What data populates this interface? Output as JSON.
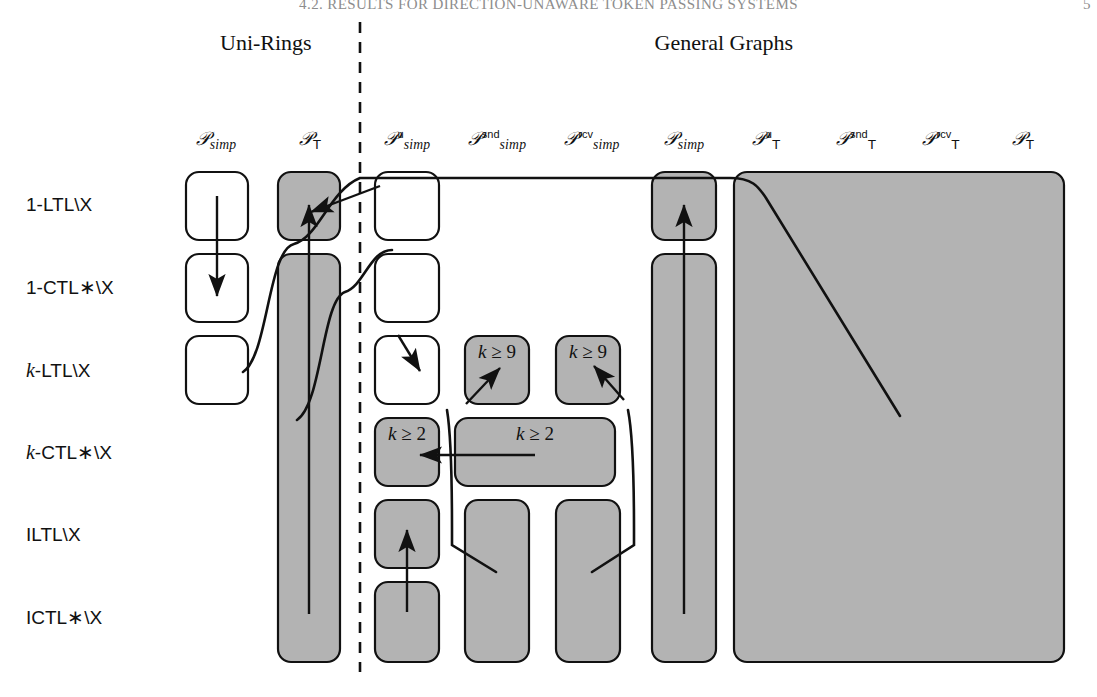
{
  "running_header": {
    "text": "4.2. RESULTS FOR DIRECTION-UNAWARE TOKEN PASSING SYSTEMS",
    "page": "5"
  },
  "groups": [
    {
      "name": "uni-rings",
      "label": "Uni-Rings",
      "cx": 266,
      "y": 30
    },
    {
      "name": "general-graphs",
      "label": "General Graphs",
      "cx": 724,
      "y": 30
    }
  ],
  "divider": {
    "x": 360,
    "y1": 22,
    "y2": 672,
    "style": "dashed"
  },
  "columns": [
    {
      "key": "ur_simp",
      "cx": 216,
      "base": "P",
      "sub": "simp",
      "sup": "",
      "tsub": false
    },
    {
      "key": "ur_T",
      "cx": 310,
      "base": "P",
      "sub": "",
      "sup": "",
      "tsub": true
    },
    {
      "key": "gg_simp_u",
      "cx": 407,
      "base": "P",
      "sub": "simp",
      "sup": "u",
      "tsub": false
    },
    {
      "key": "gg_simp_s",
      "cx": 497,
      "base": "P",
      "sub": "simp",
      "sup": "snd",
      "tsub": false
    },
    {
      "key": "gg_simp_r",
      "cx": 592,
      "base": "P",
      "sub": "simp",
      "sup": "rcv",
      "tsub": false
    },
    {
      "key": "gg_simp",
      "cx": 684,
      "base": "P",
      "sub": "simp",
      "sup": "",
      "tsub": false
    },
    {
      "key": "gg_T_u",
      "cx": 766,
      "base": "P",
      "sub": "",
      "sup": "u",
      "tsub": true
    },
    {
      "key": "gg_T_snd",
      "cx": 856,
      "base": "P",
      "sub": "",
      "sup": "snd",
      "tsub": true
    },
    {
      "key": "gg_T_rcv",
      "cx": 941,
      "base": "P",
      "sub": "",
      "sup": "rcv",
      "tsub": true
    },
    {
      "key": "gg_T",
      "cx": 1023,
      "base": "P",
      "sub": "",
      "sup": "",
      "tsub": true
    }
  ],
  "col_header_y": 128,
  "rows": [
    {
      "key": "r1",
      "label_html": "1-LTL\\X",
      "cy": 205
    },
    {
      "key": "r2",
      "label_html": "1-CTL*\\X",
      "cy": 287
    },
    {
      "key": "r3",
      "label_html": "k-LTL\\X",
      "cy": 370
    },
    {
      "key": "r4",
      "label_html": "k-CTL*\\X",
      "cy": 452
    },
    {
      "key": "r5",
      "label_html": "ILTL\\X",
      "cy": 535
    },
    {
      "key": "r6",
      "label_html": "ICTL*\\X",
      "cy": 617
    }
  ],
  "row_label_x": 26,
  "boxes": [
    {
      "name": "box-ur-simp-r1",
      "x": 186,
      "y": 172,
      "w": 62,
      "h": 68,
      "fill": "white"
    },
    {
      "name": "box-ur-simp-r2",
      "x": 186,
      "y": 254,
      "w": 62,
      "h": 68,
      "fill": "white"
    },
    {
      "name": "box-ur-simp-r3",
      "x": 186,
      "y": 336,
      "w": 62,
      "h": 68,
      "fill": "white"
    },
    {
      "name": "box-ur-T-r1",
      "x": 278,
      "y": 172,
      "w": 62,
      "h": 68,
      "fill": "gray"
    },
    {
      "name": "box-ur-T-r2r6",
      "x": 278,
      "y": 254,
      "w": 62,
      "h": 408,
      "fill": "gray"
    },
    {
      "name": "box-gg-simpu-r1",
      "x": 375,
      "y": 172,
      "w": 64,
      "h": 68,
      "fill": "white"
    },
    {
      "name": "box-gg-simpu-r2",
      "x": 375,
      "y": 254,
      "w": 64,
      "h": 68,
      "fill": "white"
    },
    {
      "name": "box-gg-simpu-r3",
      "x": 375,
      "y": 336,
      "w": 64,
      "h": 68,
      "fill": "white"
    },
    {
      "name": "box-gg-simpu-r4",
      "x": 375,
      "y": 418,
      "w": 64,
      "h": 68,
      "fill": "gray"
    },
    {
      "name": "box-gg-simpu-r5",
      "x": 375,
      "y": 500,
      "w": 64,
      "h": 68,
      "fill": "gray"
    },
    {
      "name": "box-gg-simpu-r6",
      "x": 375,
      "y": 582,
      "w": 64,
      "h": 80,
      "fill": "gray"
    },
    {
      "name": "box-gg-simpsnd-r3",
      "x": 465,
      "y": 336,
      "w": 64,
      "h": 68,
      "fill": "gray"
    },
    {
      "name": "box-gg-simpsnd-r4",
      "x": 455,
      "y": 418,
      "w": 160,
      "h": 68,
      "fill": "gray"
    },
    {
      "name": "box-gg-simpsnd-r5",
      "x": 465,
      "y": 500,
      "w": 64,
      "h": 162,
      "fill": "gray"
    },
    {
      "name": "box-gg-simprcv-r3",
      "x": 556,
      "y": 336,
      "w": 64,
      "h": 68,
      "fill": "gray"
    },
    {
      "name": "box-gg-simprcv-r5",
      "x": 556,
      "y": 500,
      "w": 64,
      "h": 162,
      "fill": "gray"
    },
    {
      "name": "box-gg-simp-r1",
      "x": 652,
      "y": 172,
      "w": 64,
      "h": 68,
      "fill": "gray"
    },
    {
      "name": "box-gg-simp-r2r6",
      "x": 652,
      "y": 254,
      "w": 64,
      "h": 408,
      "fill": "gray"
    },
    {
      "name": "box-gg-T-all",
      "x": 734,
      "y": 172,
      "w": 330,
      "h": 490,
      "fill": "gray"
    }
  ],
  "cell_notes": [
    {
      "name": "note-k-ge-9-snd",
      "text": "k ≥ 9",
      "cx": 497,
      "cy": 352
    },
    {
      "name": "note-k-ge-9-rcv",
      "text": "k ≥ 9",
      "cx": 588,
      "cy": 352
    },
    {
      "name": "note-k-ge-2-u",
      "text": "k ≥ 2",
      "cx": 407,
      "cy": 434
    },
    {
      "name": "note-k-ge-2-snd",
      "text": "k ≥ 2",
      "cx": 535,
      "cy": 434
    }
  ],
  "arrows": [
    {
      "name": "arrow-ur-simp-down",
      "d": "M 217 196 L 217 296",
      "head": "end"
    },
    {
      "name": "arrow-ur-T-up",
      "d": "M 309 614 L 309 205",
      "head": "end"
    },
    {
      "name": "arrow-gg-simp-up",
      "d": "M 684 614 L 684 205",
      "head": "end"
    },
    {
      "name": "arrow-k9-snd-up",
      "d": "M 466 404 L 500 368",
      "head": "end"
    },
    {
      "name": "arrow-k9-rcv-up",
      "d": "M 624 400 L 594 366",
      "head": "end"
    },
    {
      "name": "arrow-k2-left",
      "d": "M 535 455 L 420 455",
      "head": "end"
    },
    {
      "name": "arrow-gg-simpu-up",
      "d": "M 407 612 L 407 530",
      "head": "end"
    },
    {
      "name": "arrow-leader-urT",
      "d": "M 380 186 L 311 212",
      "head": "end"
    },
    {
      "name": "arrow-leader-simpu",
      "d": "M 398 335 L 420 371",
      "head": "end"
    }
  ],
  "leaders": [
    {
      "name": "leader-curve-top",
      "d": "M 243 372 C 268 356 268 250 294 244 C 318 238 330 190 360 178 L 730 178 C 752 178 758 186 766 198 L 900 416"
    },
    {
      "name": "leader-curve-simpu",
      "d": "M 297 420 C 322 404 322 300 345 292 C 364 286 370 250 392 250"
    },
    {
      "name": "leader-curve-snd",
      "d": "M 447 410 C 452 440 452 500 452 530 L 452 545 L 496 572"
    },
    {
      "name": "leader-curve-rcv",
      "d": "M 628 410 C 634 440 634 500 634 530 L 634 545 L 592 572"
    }
  ],
  "colors": {
    "shade": "#b3b3b3",
    "stroke": "#111111",
    "white": "#ffffff",
    "runhead": "#8d8d8d"
  }
}
